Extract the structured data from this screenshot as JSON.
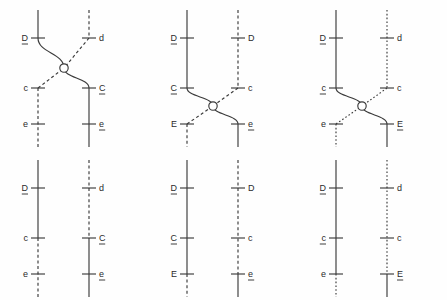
{
  "figure": {
    "background_color": "#fefefe",
    "line_color": "#3a3a3a",
    "label_color": "#2b2b2b",
    "geometry": {
      "panel_width": 149,
      "panel_height": 150,
      "locus_y": {
        "D": 38,
        "C": 88,
        "E": 124
      },
      "strand_x": {
        "left": 38,
        "right": 89
      },
      "tick_half_width": 7,
      "top_y": 10,
      "bottom_y": 147,
      "node_radius": 4.2
    }
  },
  "panels": [
    {
      "id": "panel-1",
      "name": "crossover-between-D-and-C",
      "row": 0,
      "column": 0,
      "has_crossover": true,
      "crossover": {
        "x": 64,
        "y": 68
      },
      "loci": [
        {
          "locus": "D",
          "side": "left",
          "label": "D",
          "underlined": true,
          "y": 38
        },
        {
          "locus": "D",
          "side": "right",
          "label": "d",
          "underlined": false,
          "y": 38
        },
        {
          "locus": "C",
          "side": "left",
          "label": "c",
          "underlined": false,
          "y": 88
        },
        {
          "locus": "C",
          "side": "right",
          "label": "C",
          "underlined": true,
          "y": 88
        },
        {
          "locus": "E",
          "side": "left",
          "label": "e",
          "underlined": false,
          "y": 124
        },
        {
          "locus": "E",
          "side": "right",
          "label": "e",
          "underlined": true,
          "y": 124
        }
      ],
      "strands": [
        {
          "name": "left-upper",
          "style": "solid",
          "from_y": 10,
          "to_y": 38,
          "x": 38
        },
        {
          "name": "left-lower",
          "style": "dashed",
          "from_y": 88,
          "to_y": 147,
          "x": 38
        },
        {
          "name": "right-upper",
          "style": "dashed",
          "from_y": 10,
          "to_y": 38,
          "x": 89
        },
        {
          "name": "right-lower",
          "style": "solid",
          "from_y": 88,
          "to_y": 147,
          "x": 89
        }
      ]
    },
    {
      "id": "panel-2",
      "name": "crossover-between-C-and-E",
      "row": 0,
      "column": 1,
      "has_crossover": true,
      "crossover": {
        "x": 64,
        "y": 106
      },
      "loci": [
        {
          "locus": "D",
          "side": "left",
          "label": "D",
          "underlined": true,
          "y": 38
        },
        {
          "locus": "D",
          "side": "right",
          "label": "D",
          "underlined": false,
          "y": 38
        },
        {
          "locus": "C",
          "side": "left",
          "label": "C",
          "underlined": true,
          "y": 88
        },
        {
          "locus": "C",
          "side": "right",
          "label": "c",
          "underlined": false,
          "y": 88
        },
        {
          "locus": "E",
          "side": "left",
          "label": "E",
          "underlined": false,
          "y": 124
        },
        {
          "locus": "E",
          "side": "right",
          "label": "e",
          "underlined": true,
          "y": 124
        }
      ],
      "strands": [
        {
          "name": "left-upper",
          "style": "solid",
          "from_y": 10,
          "to_y": 88,
          "x": 38
        },
        {
          "name": "left-lower",
          "style": "dashed",
          "from_y": 124,
          "to_y": 147,
          "x": 38
        },
        {
          "name": "right-upper",
          "style": "dashed",
          "from_y": 10,
          "to_y": 88,
          "x": 89
        },
        {
          "name": "right-lower",
          "style": "solid",
          "from_y": 124,
          "to_y": 147,
          "x": 89
        }
      ]
    },
    {
      "id": "panel-3",
      "name": "crossover-between-c-and-E",
      "row": 0,
      "column": 2,
      "has_crossover": true,
      "crossover": {
        "x": 64,
        "y": 106
      },
      "loci": [
        {
          "locus": "D",
          "side": "left",
          "label": "D",
          "underlined": true,
          "y": 38
        },
        {
          "locus": "D",
          "side": "right",
          "label": "d",
          "underlined": false,
          "y": 38
        },
        {
          "locus": "C",
          "side": "left",
          "label": "c",
          "underlined": true,
          "y": 88
        },
        {
          "locus": "C",
          "side": "right",
          "label": "c",
          "underlined": false,
          "y": 88
        },
        {
          "locus": "E",
          "side": "left",
          "label": "e",
          "underlined": false,
          "y": 124
        },
        {
          "locus": "E",
          "side": "right",
          "label": "E",
          "underlined": true,
          "y": 124
        }
      ],
      "strands": [
        {
          "name": "left-upper",
          "style": "solid",
          "from_y": 10,
          "to_y": 88,
          "x": 38
        },
        {
          "name": "left-lower",
          "style": "dotted",
          "from_y": 124,
          "to_y": 147,
          "x": 38
        },
        {
          "name": "right-upper",
          "style": "dotted",
          "from_y": 10,
          "to_y": 88,
          "x": 89
        },
        {
          "name": "right-lower",
          "style": "solid",
          "from_y": 124,
          "to_y": 147,
          "x": 89
        }
      ]
    },
    {
      "id": "panel-4",
      "name": "resolved-product-switch-at-C",
      "row": 1,
      "column": 0,
      "has_crossover": false,
      "loci": [
        {
          "locus": "D",
          "side": "left",
          "label": "D",
          "underlined": true,
          "y": 38
        },
        {
          "locus": "D",
          "side": "right",
          "label": "d",
          "underlined": false,
          "y": 38
        },
        {
          "locus": "C",
          "side": "left",
          "label": "c",
          "underlined": false,
          "y": 88
        },
        {
          "locus": "C",
          "side": "right",
          "label": "C",
          "underlined": true,
          "y": 88
        },
        {
          "locus": "E",
          "side": "left",
          "label": "e",
          "underlined": false,
          "y": 124
        },
        {
          "locus": "E",
          "side": "right",
          "label": "e",
          "underlined": true,
          "y": 124
        }
      ],
      "strands": [
        {
          "name": "left-upper",
          "style": "solid",
          "from_y": 10,
          "to_y": 88,
          "x": 38
        },
        {
          "name": "left-lower",
          "style": "dashed",
          "from_y": 88,
          "to_y": 147,
          "x": 38
        },
        {
          "name": "right-upper",
          "style": "dashed",
          "from_y": 10,
          "to_y": 88,
          "x": 89
        },
        {
          "name": "right-lower",
          "style": "solid",
          "from_y": 88,
          "to_y": 147,
          "x": 89
        }
      ]
    },
    {
      "id": "panel-5",
      "name": "resolved-product-switch-at-E",
      "row": 1,
      "column": 1,
      "has_crossover": false,
      "loci": [
        {
          "locus": "D",
          "side": "left",
          "label": "D",
          "underlined": true,
          "y": 38
        },
        {
          "locus": "D",
          "side": "right",
          "label": "D",
          "underlined": false,
          "y": 38
        },
        {
          "locus": "C",
          "side": "left",
          "label": "C",
          "underlined": true,
          "y": 88
        },
        {
          "locus": "C",
          "side": "right",
          "label": "c",
          "underlined": false,
          "y": 88
        },
        {
          "locus": "E",
          "side": "left",
          "label": "E",
          "underlined": false,
          "y": 124
        },
        {
          "locus": "E",
          "side": "right",
          "label": "e",
          "underlined": true,
          "y": 124
        }
      ],
      "strands": [
        {
          "name": "left-upper",
          "style": "solid",
          "from_y": 10,
          "to_y": 124,
          "x": 38
        },
        {
          "name": "left-lower",
          "style": "dashed",
          "from_y": 124,
          "to_y": 147,
          "x": 38
        },
        {
          "name": "right-upper",
          "style": "dashed",
          "from_y": 10,
          "to_y": 124,
          "x": 89
        },
        {
          "name": "right-lower",
          "style": "solid",
          "from_y": 124,
          "to_y": 147,
          "x": 89
        }
      ]
    },
    {
      "id": "panel-6",
      "name": "resolved-product-switch-at-E-variant",
      "row": 1,
      "column": 2,
      "has_crossover": false,
      "loci": [
        {
          "locus": "D",
          "side": "left",
          "label": "D",
          "underlined": true,
          "y": 38
        },
        {
          "locus": "D",
          "side": "right",
          "label": "d",
          "underlined": false,
          "y": 38
        },
        {
          "locus": "C",
          "side": "left",
          "label": "c",
          "underlined": true,
          "y": 88
        },
        {
          "locus": "C",
          "side": "right",
          "label": "c",
          "underlined": false,
          "y": 88
        },
        {
          "locus": "E",
          "side": "left",
          "label": "e",
          "underlined": false,
          "y": 124
        },
        {
          "locus": "E",
          "side": "right",
          "label": "E",
          "underlined": true,
          "y": 124
        }
      ],
      "strands": [
        {
          "name": "left-upper",
          "style": "solid",
          "from_y": 10,
          "to_y": 124,
          "x": 38
        },
        {
          "name": "left-lower",
          "style": "dotted",
          "from_y": 124,
          "to_y": 147,
          "x": 38
        },
        {
          "name": "right-upper",
          "style": "dotted",
          "from_y": 10,
          "to_y": 124,
          "x": 89
        },
        {
          "name": "right-lower",
          "style": "solid",
          "from_y": 124,
          "to_y": 147,
          "x": 89
        }
      ]
    }
  ]
}
